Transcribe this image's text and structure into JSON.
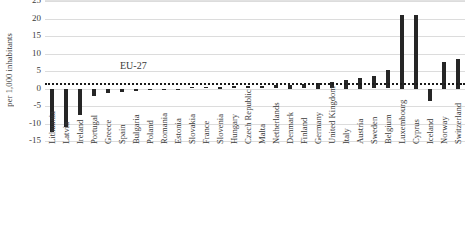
{
  "chart_data": {
    "type": "bar",
    "title": "",
    "subtitle": "",
    "xlabel": "",
    "ylabel": "per 1,000 inhabitants",
    "ylim": [
      -15,
      25
    ],
    "ytick_step": 5,
    "yticks": [
      25,
      20,
      15,
      10,
      5,
      0,
      -5,
      -10,
      -15
    ],
    "ytick_labels": [
      "25",
      "20",
      "15",
      "10",
      "5",
      "0",
      "-5",
      "-10",
      "-15"
    ],
    "grid": true,
    "grid_axis": "y",
    "legend": false,
    "legend_position": "none",
    "bar_color": "#262626",
    "reference_line": {
      "label": "EU-27",
      "value": 1.5,
      "style": "dotted",
      "color": "#1a1a1a"
    },
    "categories": [
      "Lithuania",
      "Latvia",
      "Ireland",
      "Portugal",
      "Greece",
      "Spain",
      "Bulgaria",
      "Poland",
      "Romania",
      "Estonia",
      "Slovakia",
      "France",
      "Slovenia",
      "Hungary",
      "Czech Republic",
      "Malta",
      "Netherlands",
      "Denmark",
      "Finland",
      "Germany",
      "United Kingdom",
      "Italy",
      "Austria",
      "Sweden",
      "Belgium",
      "Luxembourg",
      "Cyprus",
      "Iceland",
      "Norway",
      "Switzerland"
    ],
    "values": [
      -12.5,
      -11.0,
      -7.5,
      -2.0,
      -1.2,
      -1.0,
      -0.8,
      -0.5,
      -0.4,
      -0.3,
      0.3,
      0.4,
      0.5,
      0.6,
      0.7,
      0.8,
      0.9,
      1.0,
      1.2,
      1.5,
      1.8,
      2.5,
      3.0,
      3.6,
      5.2,
      21.0,
      21.0,
      -3.5,
      7.5,
      8.5
    ]
  }
}
